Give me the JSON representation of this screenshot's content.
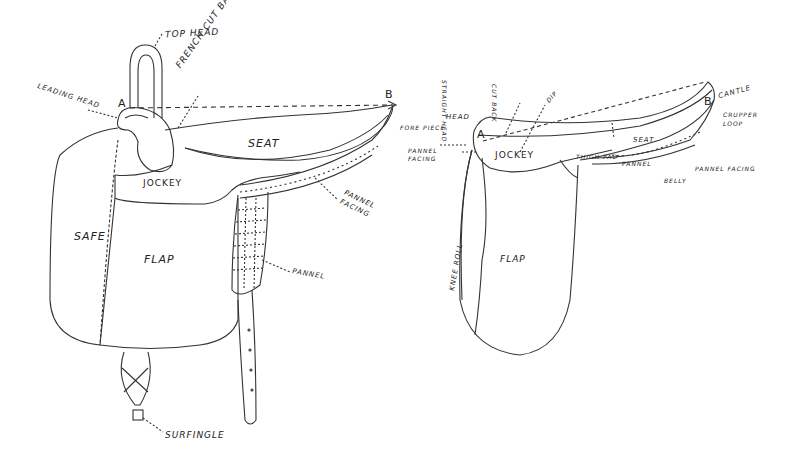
{
  "diagram": {
    "left_saddle": {
      "points": {
        "a": "A",
        "b": "B"
      },
      "labels": {
        "top_head": "TOP HEAD",
        "french_cut_back_head": "FRENCH CUT BACK HEAD",
        "leading_head": "LEADING HEAD",
        "seat": "SEAT",
        "jockey": "JOCKEY",
        "pannel_facing": "PANNEL FACING",
        "safe": "SAFE",
        "flap": "FLAP",
        "pannel": "PANNEL",
        "surfingle": "SURFINGLE"
      }
    },
    "right_saddle": {
      "points": {
        "a": "A",
        "b": "B"
      },
      "labels": {
        "head": "HEAD",
        "vertical_1": "STRAIGHT HEAD",
        "vertical_2": "CUT BACK",
        "fore_piece": "FORE PIECE",
        "pannel_facing_left": "PANNEL FACING",
        "jockey": "JOCKEY",
        "seat_arrow": "DIP",
        "seat": "SEAT",
        "cantle": "CANTLE",
        "crupper_loop": "CRUPPER LOOP",
        "thigh_pad": "THIGH PAD",
        "pannel": "PANNEL",
        "pannel_facing_right": "PANNEL FACING",
        "belly": "BELLY",
        "knee_roll": "KNEE ROLL",
        "flap": "FLAP"
      }
    }
  }
}
